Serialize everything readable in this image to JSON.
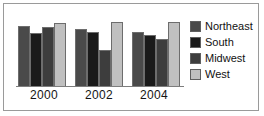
{
  "chart_data": {
    "type": "bar",
    "title": "",
    "subtitle": "",
    "xlabel": "",
    "ylabel": "",
    "categories": [
      "2000",
      "2002",
      "2004"
    ],
    "series": [
      {
        "name": "Northeast",
        "color": "#4a4a4a",
        "values": [
          80,
          76,
          72
        ]
      },
      {
        "name": "South",
        "color": "#1a1a1a",
        "values": [
          70,
          72,
          68
        ]
      },
      {
        "name": "Midwest",
        "color": "#3d3d3d",
        "values": [
          78,
          48,
          62
        ]
      },
      {
        "name": "West",
        "color": "#c0c0c0",
        "values": [
          83,
          85,
          85
        ]
      }
    ],
    "ylim": [
      0,
      95
    ],
    "grid": false,
    "legend_position": "right",
    "annotations": []
  },
  "axis": {
    "ticks": [
      "2000",
      "2002",
      "2004"
    ]
  },
  "legend": {
    "entries": [
      {
        "label": "Northeast",
        "swatch": "legend-swatch-northeast"
      },
      {
        "label": "South",
        "swatch": "legend-swatch-south"
      },
      {
        "label": "Midwest",
        "swatch": "legend-swatch-midwest"
      },
      {
        "label": "West",
        "swatch": "legend-swatch-west"
      }
    ]
  }
}
